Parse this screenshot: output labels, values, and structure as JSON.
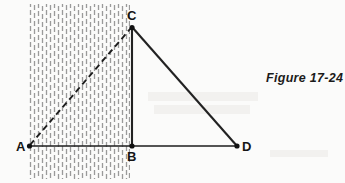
{
  "figure": {
    "caption": "Figure 17-24",
    "background_color": "#fbfbfa",
    "line_color": "#1d1d1d",
    "hatch_color": "#9a9a9a",
    "labels": {
      "a": "A",
      "b": "B",
      "c": "C",
      "d": "D"
    },
    "geometry": {
      "points": {
        "A": {
          "x": 29,
          "y": 146
        },
        "B": {
          "x": 132,
          "y": 146
        },
        "C": {
          "x": 132,
          "y": 27
        },
        "D": {
          "x": 237,
          "y": 146
        }
      },
      "segments": [
        {
          "name": "AB",
          "from": "A",
          "to": "B",
          "style": "solid"
        },
        {
          "name": "BD",
          "from": "B",
          "to": "D",
          "style": "solid"
        },
        {
          "name": "CB",
          "from": "C",
          "to": "B",
          "style": "solid"
        },
        {
          "name": "CD",
          "from": "C",
          "to": "D",
          "style": "solid"
        },
        {
          "name": "AC",
          "from": "A",
          "to": "C",
          "style": "dashed"
        }
      ],
      "hatched_region": {
        "x": 29,
        "y": 4,
        "width": 101,
        "height": 175,
        "orientation": "vertical",
        "dash_pattern": "5 3",
        "spacing": 4
      }
    }
  }
}
